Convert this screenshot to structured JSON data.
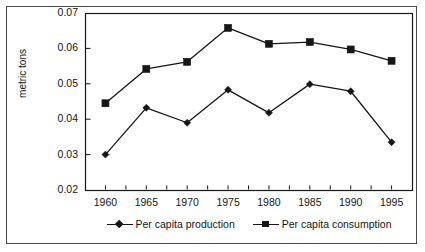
{
  "chart_data": {
    "type": "line",
    "title": "",
    "subtitle": "",
    "xlabel": "",
    "ylabel": "metric tons",
    "x": [
      1960,
      1965,
      1970,
      1975,
      1980,
      1985,
      1990,
      1995
    ],
    "categories": [
      "1960",
      "1965",
      "1970",
      "1975",
      "1980",
      "1985",
      "1990",
      "1995"
    ],
    "series": [
      {
        "name": "Per capita production",
        "marker": "diamond",
        "color": "#161616",
        "values": [
          0.03,
          0.0432,
          0.039,
          0.0483,
          0.0418,
          0.0499,
          0.0479,
          0.0335
        ]
      },
      {
        "name": "Per capita consumption",
        "marker": "square",
        "color": "#161616",
        "values": [
          0.0445,
          0.0542,
          0.0562,
          0.0658,
          0.0613,
          0.0618,
          0.0597,
          0.0565
        ]
      }
    ],
    "xlim": [
      1957.5,
      1997.5
    ],
    "ylim": [
      0.02,
      0.07
    ],
    "ytick_labels": [
      "0.02",
      "0.03",
      "0.04",
      "0.05",
      "0.06",
      "0.07"
    ],
    "ytick_values": [
      0.02,
      0.03,
      0.04,
      0.05,
      0.06,
      0.07
    ],
    "xtick_labels": [
      "1960",
      "1965",
      "1970",
      "1975",
      "1980",
      "1985",
      "1990",
      "1995"
    ],
    "grid": false,
    "legend_position": "bottom",
    "frame": true
  },
  "legend": {
    "items": [
      {
        "label": "Per capita production",
        "marker": "diamond"
      },
      {
        "label": "Per capita consumption",
        "marker": "square"
      }
    ]
  },
  "colors": {
    "ink": "#161616",
    "frame": "#4a4a4a",
    "background": "#ffffff"
  }
}
